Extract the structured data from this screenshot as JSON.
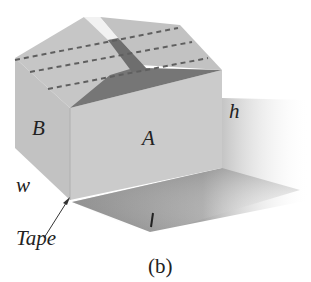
{
  "figure": {
    "caption": "(b)",
    "labels": {
      "face_front": "A",
      "face_side": "B",
      "height": "h",
      "width": "w",
      "length": "l",
      "tape": "Tape"
    },
    "colors": {
      "face_front": "#c9c9c9",
      "face_side": "#c2c2c2",
      "top_panel": "#c4c4c4",
      "flap_shadow": "#7a7a7a",
      "fold_lines": "#6a6a6a",
      "cast_shadow": "#8a8a8a"
    }
  }
}
